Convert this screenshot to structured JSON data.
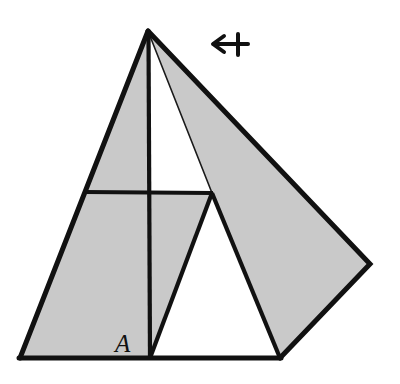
{
  "figure": {
    "kind": "geometry-diagram",
    "background_color": "#ffffff",
    "shade_color": "#c9c9c9",
    "shade_color_dark": "#bdbdbd",
    "stroke_color": "#111111",
    "white_fill": "#ffffff",
    "stroke_width_thick": 5,
    "stroke_width_medium": 4,
    "stroke_width_thin": 1.4,
    "canvas": {
      "width": 400,
      "height": 384
    },
    "labels": [
      {
        "name": "region-label-a",
        "text": "A",
        "x": 115,
        "y": 332,
        "italic": true,
        "font_size": 25
      }
    ],
    "points": {
      "apex": [
        148,
        31
      ],
      "base_left": [
        20,
        358
      ],
      "base_mid": [
        150,
        358
      ],
      "base_right": [
        280,
        358
      ],
      "crossbar_left": [
        85,
        192
      ],
      "crossbar_right": [
        212,
        193
      ],
      "inner_apex": [
        212,
        193
      ],
      "flap_far_right": [
        370,
        264
      ]
    },
    "shapes": [
      {
        "name": "shaded-left-triangle",
        "type": "polygon",
        "fill": "shade",
        "points": "148,31 20,358 150,358"
      },
      {
        "name": "shaded-right-flap",
        "type": "polygon",
        "fill": "shade",
        "points": "148,31 370,264 280,358 212,193"
      },
      {
        "name": "shaded-wedge-under-crossbar",
        "type": "polygon",
        "fill": "shade",
        "points": "150,358 212,193 150,193"
      },
      {
        "name": "white-inner-triangle",
        "type": "polygon",
        "fill": "white",
        "points": "212,193 150,358 280,358"
      }
    ],
    "edges": [
      {
        "name": "edge-apex-to-base-left",
        "from": "apex",
        "to": "base_left",
        "weight": "thick"
      },
      {
        "name": "edge-base-line",
        "from": "base_left",
        "to": "base_right",
        "weight": "thick"
      },
      {
        "name": "edge-apex-to-flap-far-right",
        "from": "apex",
        "to": "flap_far_right",
        "weight": "thick"
      },
      {
        "name": "edge-flap-far-right-to-base-right",
        "from": "flap_far_right",
        "to": "base_right",
        "weight": "thick"
      },
      {
        "name": "edge-vertical-altitude",
        "from": "apex",
        "to": "base_mid",
        "weight": "medium"
      },
      {
        "name": "edge-crossbar-horizontal",
        "from": "crossbar_left",
        "to": "crossbar_right",
        "weight": "medium"
      },
      {
        "name": "edge-inner-triangle-left",
        "from": "inner_apex",
        "to": "base_mid",
        "weight": "medium"
      },
      {
        "name": "edge-inner-triangle-right",
        "from": "inner_apex",
        "to": "base_right",
        "weight": "medium"
      },
      {
        "name": "edge-apex-to-inner-apex-thin",
        "from": "apex",
        "to": "inner_apex",
        "weight": "thin"
      }
    ],
    "annotation": {
      "name": "fold-direction-arrow",
      "icon": "leftwards-arrow-from-bar-icon",
      "glyph": "↤",
      "description": "left-pointing arrow with vertical bar at tail",
      "x1": 248,
      "y1": 44,
      "x2": 213,
      "y2": 44,
      "bar_x": 238,
      "bar_top": 34,
      "bar_bottom": 54,
      "head_length": 11,
      "head_spread": 8,
      "stroke_width": 4
    }
  }
}
